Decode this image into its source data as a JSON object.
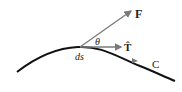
{
  "diagram": {
    "labels": {
      "force": "F",
      "tangent": "T̂",
      "angle": "θ",
      "arc_element": "ds",
      "curve": "C"
    },
    "colors": {
      "curve": "#111111",
      "vectors": "#7a7a7a",
      "text": "#222222"
    }
  }
}
